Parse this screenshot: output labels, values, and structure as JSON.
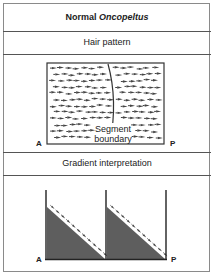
{
  "header": {
    "title_prefix": "Normal ",
    "title_species": "Oncopeltus"
  },
  "sections": [
    {
      "title": "Hair pattern",
      "diagram": {
        "type": "hair-field",
        "segment_label_line1": "Segment",
        "segment_label_line2": "boundary",
        "left_label": "A",
        "right_label": "P",
        "hair_direction": "posterior (right-pointing)"
      }
    },
    {
      "title": "Gradient interpretation",
      "diagram": {
        "type": "sawtooth-gradient",
        "left_label": "A",
        "right_label": "P",
        "segments": 2
      }
    }
  ],
  "colors": {
    "border": "#8a8a8a",
    "line": "#333333",
    "gradient_fill": "#5e5e5e",
    "hair": "#444444"
  }
}
